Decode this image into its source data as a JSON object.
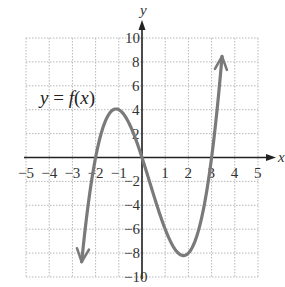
{
  "chart_data": {
    "type": "line",
    "title": "",
    "xlabel": "x",
    "ylabel": "y",
    "xlim": [
      -5,
      5
    ],
    "ylim": [
      -10,
      10
    ],
    "grid": true,
    "x_ticks": [
      -5,
      -4,
      -3,
      -2,
      -1,
      1,
      2,
      3,
      4,
      5
    ],
    "y_ticks": [
      10,
      8,
      6,
      4,
      2,
      -2,
      -4,
      -6,
      -8,
      -10
    ],
    "annotation": "y = f(x)",
    "series": [
      {
        "name": "f(x)",
        "function": "x^3 - x^2 - 6x",
        "x_range": [
          -2.6,
          3.45
        ],
        "key_points": [
          {
            "x": -2,
            "y": 0,
            "label": "root"
          },
          {
            "x": -1,
            "y": 4,
            "label": "local max"
          },
          {
            "x": 0,
            "y": 0,
            "label": "root"
          },
          {
            "x": 2,
            "y": -8,
            "label": "local min"
          },
          {
            "x": 3,
            "y": 0,
            "label": "root"
          }
        ],
        "end_arrows": true
      }
    ]
  },
  "labels": {
    "x_axis": "x",
    "y_axis": "y",
    "function_label": "y = f(x)"
  },
  "colors": {
    "curve": "#7a7a7a",
    "axis": "#222222",
    "grid": "#b8b8b8"
  }
}
